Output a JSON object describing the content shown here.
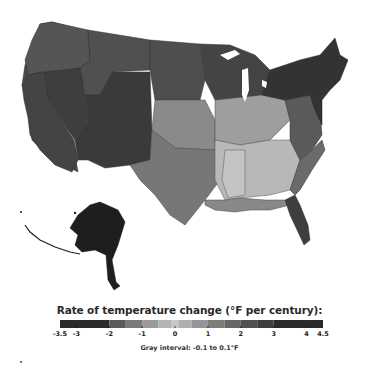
{
  "map": {
    "title": "Rate of temperature change (°F per century):",
    "subject": "Contiguous United States and Alaska climate divisions",
    "regions": [
      {
        "name": "Pacific Northwest",
        "rate_f_per_century": 1.8
      },
      {
        "name": "California",
        "rate_f_per_century": 2.4
      },
      {
        "name": "Great Basin",
        "rate_f_per_century": 2.6
      },
      {
        "name": "Southwest",
        "rate_f_per_century": 3.0
      },
      {
        "name": "Northern Rockies",
        "rate_f_per_century": 2.2
      },
      {
        "name": "Northern Plains",
        "rate_f_per_century": 2.0
      },
      {
        "name": "Central Plains",
        "rate_f_per_century": 0.6
      },
      {
        "name": "Southern Plains",
        "rate_f_per_century": 0.8
      },
      {
        "name": "Upper Midwest",
        "rate_f_per_century": 2.8
      },
      {
        "name": "Ohio Valley",
        "rate_f_per_century": 0.5
      },
      {
        "name": "Southeast",
        "rate_f_per_century": 0.0
      },
      {
        "name": "Mississippi Valley",
        "rate_f_per_century": -0.5
      },
      {
        "name": "Mid-Atlantic",
        "rate_f_per_century": 2.2
      },
      {
        "name": "Northeast / New England",
        "rate_f_per_century": 3.0
      },
      {
        "name": "Florida",
        "rate_f_per_century": 2.6
      },
      {
        "name": "Gulf Coast",
        "rate_f_per_century": 1.4
      },
      {
        "name": "Alaska",
        "rate_f_per_century": 4.0
      }
    ]
  },
  "legend": {
    "title": "Rate of temperature change (°F per century):",
    "min": -3.5,
    "max": 4.5,
    "tick_labels": [
      "-3.5",
      "-3",
      "-2",
      "-1",
      "0",
      "1",
      "2",
      "3",
      "4",
      "4.5"
    ],
    "tick_values": [
      -3.5,
      -3,
      -2,
      -1,
      0,
      1,
      2,
      3,
      4,
      4.5
    ],
    "bins": [
      {
        "from": -3.5,
        "to": -2.0,
        "color": "#2b2b2b"
      },
      {
        "from": -2.0,
        "to": -1.5,
        "color": "#5a5a5a"
      },
      {
        "from": -1.5,
        "to": -1.0,
        "color": "#7a7a7a"
      },
      {
        "from": -1.0,
        "to": -0.5,
        "color": "#9a9a9a"
      },
      {
        "from": -0.5,
        "to": -0.1,
        "color": "#b4b4b4"
      },
      {
        "from": -0.1,
        "to": 0.1,
        "color": "#c8c8c8"
      },
      {
        "from": 0.1,
        "to": 0.5,
        "color": "#b0b0b0"
      },
      {
        "from": 0.5,
        "to": 1.0,
        "color": "#959595"
      },
      {
        "from": 1.0,
        "to": 1.5,
        "color": "#7d7d7d"
      },
      {
        "from": 1.5,
        "to": 2.0,
        "color": "#676767"
      },
      {
        "from": 2.0,
        "to": 2.5,
        "color": "#505050"
      },
      {
        "from": 2.5,
        "to": 3.0,
        "color": "#3e3e3e"
      },
      {
        "from": 3.0,
        "to": 4.5,
        "color": "#2a2a2a"
      }
    ],
    "gray_interval_note": "Gray interval: -0.1 to 0.1°F"
  }
}
